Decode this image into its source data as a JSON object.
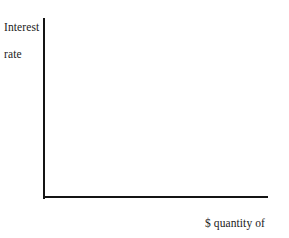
{
  "figure": {
    "background_color": "#ffffff",
    "ink_color": "#141414",
    "width": 289,
    "height": 238
  },
  "axes": {
    "vertical": {
      "name": "interest-rate-axis",
      "label_line1": "Interest",
      "label_line2": "rate",
      "label_full": "Interest rate"
    },
    "horizontal": {
      "name": "loanable-funds-axis",
      "label_line1": "$ quantity of",
      "label_line2": "loanable funds",
      "label_full": "$ quantity of loanable funds"
    }
  },
  "chart_data": {
    "type": "line",
    "title": "",
    "subtitle": "",
    "xlabel": "$ quantity of loanable funds",
    "ylabel": "Interest rate",
    "series": [],
    "categories": [],
    "x": [],
    "values": [],
    "annotations": [],
    "legend": {
      "entries": [],
      "position": "none"
    },
    "grid": false,
    "xticks": [],
    "yticks": [],
    "xticklabels": [],
    "yticklabels": [],
    "xlim": [
      0,
      1
    ],
    "ylim": [
      0,
      1
    ],
    "note": "Empty loanable funds framework: blank first-quadrant axes with no curves, tick marks, or data plotted."
  }
}
